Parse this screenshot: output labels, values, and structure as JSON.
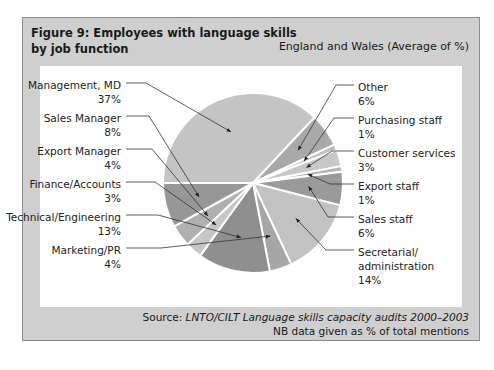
{
  "figure": {
    "title_line1": "Figure 9: Employees with language skills",
    "title_line2": "by job function",
    "subtitle": "England and Wales (Average of %)",
    "source_prefix": "Source: ",
    "source_italic": "LNTO/CILT Language skills capacity audits 2000–2003",
    "note": "NB data given as % of total mentions"
  },
  "chart_data": {
    "type": "pie",
    "title": "Figure 9: Employees with language skills by job function",
    "subtitle": "England and Wales (Average of %)",
    "unit": "%",
    "categories": [
      "Management, MD",
      "Other",
      "Purchasing staff",
      "Customer services",
      "Export staff",
      "Sales staff",
      "Secretarial/ administration",
      "Marketing/PR",
      "Technical/Engineering",
      "Finance/Accounts",
      "Export Manager",
      "Sales Manager"
    ],
    "values": [
      37,
      6,
      1,
      3,
      1,
      6,
      14,
      4,
      13,
      3,
      4,
      8
    ],
    "slice_colors": [
      "#c4c4c4",
      "#a9a9a9",
      "#bdbdbd",
      "#c8c8c8",
      "#b5b5b5",
      "#9a9a9a",
      "#c2c2c2",
      "#a6a6a6",
      "#8f8f8f",
      "#c6c6c6",
      "#b0b0b0",
      "#979797"
    ],
    "start_angle_deg": 270,
    "direction": "clockwise",
    "labels": [
      {
        "text": "Management, MD",
        "pct": "37%",
        "side": "left"
      },
      {
        "text": "Sales Manager",
        "pct": "8%",
        "side": "left"
      },
      {
        "text": "Export Manager",
        "pct": "4%",
        "side": "left"
      },
      {
        "text": "Finance/Accounts",
        "pct": "3%",
        "side": "left"
      },
      {
        "text": "Technical/Engineering",
        "pct": "13%",
        "side": "left"
      },
      {
        "text": "Marketing/PR",
        "pct": "4%",
        "side": "left"
      },
      {
        "text": "Other",
        "pct": "6%",
        "side": "right"
      },
      {
        "text": "Purchasing staff",
        "pct": "1%",
        "side": "right"
      },
      {
        "text": "Customer services",
        "pct": "3%",
        "side": "right"
      },
      {
        "text": "Export staff",
        "pct": "1%",
        "side": "right"
      },
      {
        "text": "Sales staff",
        "pct": "6%",
        "side": "right"
      },
      {
        "text": "Secretarial/",
        "text2": "administration",
        "pct": "14%",
        "side": "right"
      }
    ]
  }
}
